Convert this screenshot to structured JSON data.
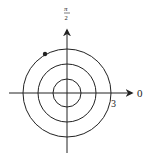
{
  "diagram": {
    "type": "polar-grid",
    "center": {
      "x": 67,
      "y": 93
    },
    "circles": [
      {
        "name": "inner",
        "radius": 14
      },
      {
        "name": "middle",
        "radius": 29
      },
      {
        "name": "outer",
        "radius": 44
      }
    ],
    "labels": {
      "polar_axis": "0",
      "vertical_axis_top": "π",
      "vertical_axis_bottom": "2",
      "radius_mark": "3"
    },
    "point": {
      "x": 45,
      "y": 54
    },
    "colors": {
      "stroke": "#222222",
      "background": "#ffffff"
    }
  }
}
